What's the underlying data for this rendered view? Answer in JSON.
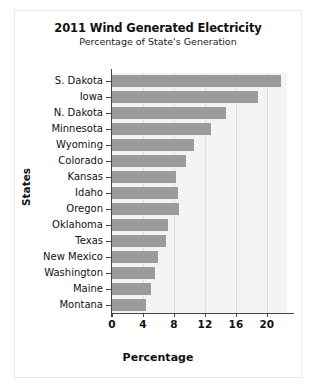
{
  "chart_data": {
    "type": "bar",
    "orientation": "horizontal",
    "title": "2011 Wind Generated Electricity",
    "subtitle": "Percentage of State's Generation",
    "xlabel": "Percentage",
    "ylabel": "States",
    "categories": [
      "S. Dakota",
      "Iowa",
      "N. Dakota",
      "Minnesota",
      "Wyoming",
      "Colorado",
      "Kansas",
      "Idaho",
      "Oregon",
      "Oklahoma",
      "Texas",
      "New Mexico",
      "Washington",
      "Maine",
      "Montana"
    ],
    "values": [
      21.8,
      18.8,
      14.7,
      12.8,
      10.6,
      9.5,
      8.3,
      8.5,
      8.6,
      7.2,
      7.0,
      5.9,
      5.6,
      5.0,
      4.4
    ],
    "xlim": [
      0,
      22.6
    ],
    "xticks": [
      0,
      4,
      8,
      12,
      16,
      20
    ],
    "xtick_labels": [
      "0",
      "4",
      "8",
      "12",
      "16",
      "20"
    ],
    "grid": true,
    "grid_axis": "x",
    "legend": null,
    "bar_color": "#9a9a9a",
    "plot_background": "#f4f4f4",
    "gridline_color": "#dcdcdc",
    "axis_color": "#444444",
    "figure_background": "#ffffff"
  }
}
